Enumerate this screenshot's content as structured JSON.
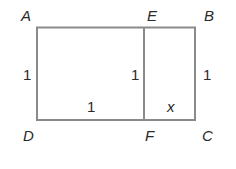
{
  "diagram": {
    "vertices": {
      "A": "A",
      "E": "E",
      "B": "B",
      "D": "D",
      "F": "F",
      "C": "C"
    },
    "side_labels": {
      "AD": "1",
      "EF": "1",
      "BC": "1",
      "DF": "1",
      "FC": "x"
    },
    "colors": {
      "stroke": "#8a8a8a",
      "text": "#2a2a2a"
    }
  }
}
